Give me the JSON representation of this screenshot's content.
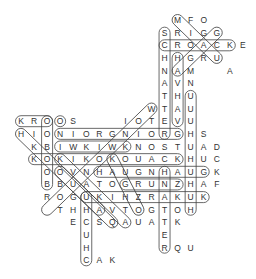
{
  "puzzle": {
    "type": "word-search",
    "grid_origin": {
      "x": 21,
      "y": 20
    },
    "cell_size": {
      "w": 13.05,
      "h": 12.65
    },
    "letters": [
      {
        "r": 0,
        "c": 12,
        "ch": "M"
      },
      {
        "r": 0,
        "c": 13,
        "ch": "F"
      },
      {
        "r": 0,
        "c": 14,
        "ch": "O"
      },
      {
        "r": 1,
        "c": 11,
        "ch": "S"
      },
      {
        "r": 1,
        "c": 12,
        "ch": "R"
      },
      {
        "r": 1,
        "c": 13,
        "ch": "I"
      },
      {
        "r": 1,
        "c": 14,
        "ch": "G"
      },
      {
        "r": 1,
        "c": 15,
        "ch": "G"
      },
      {
        "r": 2,
        "c": 11,
        "ch": "C"
      },
      {
        "r": 2,
        "c": 12,
        "ch": "R"
      },
      {
        "r": 2,
        "c": 13,
        "ch": "O"
      },
      {
        "r": 2,
        "c": 14,
        "ch": "A"
      },
      {
        "r": 2,
        "c": 15,
        "ch": "C"
      },
      {
        "r": 2,
        "c": 16,
        "ch": "K"
      },
      {
        "r": 2,
        "c": 17,
        "ch": "E"
      },
      {
        "r": 3,
        "c": 11,
        "ch": "H"
      },
      {
        "r": 3,
        "c": 12,
        "ch": "H"
      },
      {
        "r": 3,
        "c": 13,
        "ch": "G"
      },
      {
        "r": 3,
        "c": 14,
        "ch": "R"
      },
      {
        "r": 3,
        "c": 15,
        "ch": "U"
      },
      {
        "r": 4,
        "c": 11,
        "ch": "N"
      },
      {
        "r": 4,
        "c": 12,
        "ch": "A"
      },
      {
        "r": 4,
        "c": 13,
        "ch": "M"
      },
      {
        "r": 4,
        "c": 16,
        "ch": "A"
      },
      {
        "r": 5,
        "c": 11,
        "ch": "A"
      },
      {
        "r": 5,
        "c": 12,
        "ch": "V"
      },
      {
        "r": 5,
        "c": 13,
        "ch": "N"
      },
      {
        "r": 6,
        "c": 11,
        "ch": "T"
      },
      {
        "r": 6,
        "c": 12,
        "ch": "H"
      },
      {
        "r": 6,
        "c": 13,
        "ch": "U"
      },
      {
        "r": 7,
        "c": 10,
        "ch": "W"
      },
      {
        "r": 7,
        "c": 11,
        "ch": "T"
      },
      {
        "r": 7,
        "c": 12,
        "ch": "A"
      },
      {
        "r": 7,
        "c": 13,
        "ch": "U"
      },
      {
        "r": 8,
        "c": 0,
        "ch": "K"
      },
      {
        "r": 8,
        "c": 1,
        "ch": "R"
      },
      {
        "r": 8,
        "c": 2,
        "ch": "O"
      },
      {
        "r": 8,
        "c": 3,
        "ch": "O"
      },
      {
        "r": 8,
        "c": 4,
        "ch": "S"
      },
      {
        "r": 8,
        "c": 8,
        "ch": "I"
      },
      {
        "r": 8,
        "c": 9,
        "ch": "O"
      },
      {
        "r": 8,
        "c": 10,
        "ch": "T"
      },
      {
        "r": 8,
        "c": 11,
        "ch": "E"
      },
      {
        "r": 8,
        "c": 12,
        "ch": "V"
      },
      {
        "r": 8,
        "c": 13,
        "ch": "U"
      },
      {
        "r": 9,
        "c": 0,
        "ch": "H"
      },
      {
        "r": 9,
        "c": 1,
        "ch": "I"
      },
      {
        "r": 9,
        "c": 2,
        "ch": "O"
      },
      {
        "r": 9,
        "c": 3,
        "ch": "N"
      },
      {
        "r": 9,
        "c": 4,
        "ch": "I"
      },
      {
        "r": 9,
        "c": 5,
        "ch": "O"
      },
      {
        "r": 9,
        "c": 6,
        "ch": "R"
      },
      {
        "r": 9,
        "c": 7,
        "ch": "G"
      },
      {
        "r": 9,
        "c": 8,
        "ch": "N"
      },
      {
        "r": 9,
        "c": 9,
        "ch": "I"
      },
      {
        "r": 9,
        "c": 10,
        "ch": "O"
      },
      {
        "r": 9,
        "c": 11,
        "ch": "R"
      },
      {
        "r": 9,
        "c": 12,
        "ch": "G"
      },
      {
        "r": 9,
        "c": 13,
        "ch": "H"
      },
      {
        "r": 9,
        "c": 14,
        "ch": "S"
      },
      {
        "r": 10,
        "c": 1,
        "ch": "K"
      },
      {
        "r": 10,
        "c": 2,
        "ch": "B"
      },
      {
        "r": 10,
        "c": 3,
        "ch": "I"
      },
      {
        "r": 10,
        "c": 4,
        "ch": "W"
      },
      {
        "r": 10,
        "c": 5,
        "ch": "K"
      },
      {
        "r": 10,
        "c": 6,
        "ch": "I"
      },
      {
        "r": 10,
        "c": 7,
        "ch": "W"
      },
      {
        "r": 10,
        "c": 8,
        "ch": "K"
      },
      {
        "r": 10,
        "c": 9,
        "ch": "N"
      },
      {
        "r": 10,
        "c": 10,
        "ch": "O"
      },
      {
        "r": 10,
        "c": 11,
        "ch": "S"
      },
      {
        "r": 10,
        "c": 12,
        "ch": "T"
      },
      {
        "r": 10,
        "c": 13,
        "ch": "U"
      },
      {
        "r": 10,
        "c": 14,
        "ch": "A"
      },
      {
        "r": 10,
        "c": 15,
        "ch": "D"
      },
      {
        "r": 11,
        "c": 1,
        "ch": "K"
      },
      {
        "r": 11,
        "c": 2,
        "ch": "O"
      },
      {
        "r": 11,
        "c": 3,
        "ch": "K"
      },
      {
        "r": 11,
        "c": 4,
        "ch": "I"
      },
      {
        "r": 11,
        "c": 5,
        "ch": "K"
      },
      {
        "r": 11,
        "c": 6,
        "ch": "O"
      },
      {
        "r": 11,
        "c": 7,
        "ch": "K"
      },
      {
        "r": 11,
        "c": 8,
        "ch": "O"
      },
      {
        "r": 11,
        "c": 9,
        "ch": "U"
      },
      {
        "r": 11,
        "c": 10,
        "ch": "A"
      },
      {
        "r": 11,
        "c": 11,
        "ch": "C"
      },
      {
        "r": 11,
        "c": 12,
        "ch": "K"
      },
      {
        "r": 11,
        "c": 13,
        "ch": "H"
      },
      {
        "r": 11,
        "c": 14,
        "ch": "U"
      },
      {
        "r": 11,
        "c": 15,
        "ch": "C"
      },
      {
        "r": 12,
        "c": 2,
        "ch": "O"
      },
      {
        "r": 12,
        "c": 3,
        "ch": "O"
      },
      {
        "r": 12,
        "c": 4,
        "ch": "V"
      },
      {
        "r": 12,
        "c": 5,
        "ch": "N"
      },
      {
        "r": 12,
        "c": 6,
        "ch": "H"
      },
      {
        "r": 12,
        "c": 7,
        "ch": "A"
      },
      {
        "r": 12,
        "c": 8,
        "ch": "U"
      },
      {
        "r": 12,
        "c": 9,
        "ch": "G"
      },
      {
        "r": 12,
        "c": 10,
        "ch": "N"
      },
      {
        "r": 12,
        "c": 11,
        "ch": "H"
      },
      {
        "r": 12,
        "c": 12,
        "ch": "A"
      },
      {
        "r": 12,
        "c": 13,
        "ch": "U"
      },
      {
        "r": 12,
        "c": 14,
        "ch": "G"
      },
      {
        "r": 12,
        "c": 15,
        "ch": "K"
      },
      {
        "r": 13,
        "c": 2,
        "ch": "B"
      },
      {
        "r": 13,
        "c": 3,
        "ch": "B"
      },
      {
        "r": 13,
        "c": 4,
        "ch": "U"
      },
      {
        "r": 13,
        "c": 5,
        "ch": "A"
      },
      {
        "r": 13,
        "c": 6,
        "ch": "T"
      },
      {
        "r": 13,
        "c": 7,
        "ch": "O"
      },
      {
        "r": 13,
        "c": 8,
        "ch": "G"
      },
      {
        "r": 13,
        "c": 9,
        "ch": "R"
      },
      {
        "r": 13,
        "c": 10,
        "ch": "U"
      },
      {
        "r": 13,
        "c": 11,
        "ch": "N"
      },
      {
        "r": 13,
        "c": 12,
        "ch": "Z"
      },
      {
        "r": 13,
        "c": 13,
        "ch": "H"
      },
      {
        "r": 13,
        "c": 14,
        "ch": "A"
      },
      {
        "r": 13,
        "c": 15,
        "ch": "F"
      },
      {
        "r": 14,
        "c": 2,
        "ch": "R"
      },
      {
        "r": 14,
        "c": 3,
        "ch": "O"
      },
      {
        "r": 14,
        "c": 4,
        "ch": "G"
      },
      {
        "r": 14,
        "c": 5,
        "ch": "U"
      },
      {
        "r": 14,
        "c": 6,
        "ch": "K"
      },
      {
        "r": 14,
        "c": 7,
        "ch": "I"
      },
      {
        "r": 14,
        "c": 8,
        "ch": "H"
      },
      {
        "r": 14,
        "c": 9,
        "ch": "Z"
      },
      {
        "r": 14,
        "c": 10,
        "ch": "R"
      },
      {
        "r": 14,
        "c": 11,
        "ch": "A"
      },
      {
        "r": 14,
        "c": 12,
        "ch": "K"
      },
      {
        "r": 14,
        "c": 13,
        "ch": "U"
      },
      {
        "r": 14,
        "c": 14,
        "ch": "K"
      },
      {
        "r": 15,
        "c": 3,
        "ch": "T"
      },
      {
        "r": 15,
        "c": 4,
        "ch": "H"
      },
      {
        "r": 15,
        "c": 5,
        "ch": "H"
      },
      {
        "r": 15,
        "c": 6,
        "ch": "A"
      },
      {
        "r": 15,
        "c": 7,
        "ch": "V"
      },
      {
        "r": 15,
        "c": 8,
        "ch": "T"
      },
      {
        "r": 15,
        "c": 9,
        "ch": "O"
      },
      {
        "r": 15,
        "c": 10,
        "ch": "G"
      },
      {
        "r": 15,
        "c": 11,
        "ch": "T"
      },
      {
        "r": 15,
        "c": 12,
        "ch": "O"
      },
      {
        "r": 15,
        "c": 13,
        "ch": "H"
      },
      {
        "r": 16,
        "c": 4,
        "ch": "E"
      },
      {
        "r": 16,
        "c": 5,
        "ch": "C"
      },
      {
        "r": 16,
        "c": 6,
        "ch": "S"
      },
      {
        "r": 16,
        "c": 7,
        "ch": "Q"
      },
      {
        "r": 16,
        "c": 8,
        "ch": "A"
      },
      {
        "r": 16,
        "c": 9,
        "ch": "U"
      },
      {
        "r": 16,
        "c": 10,
        "ch": "A"
      },
      {
        "r": 16,
        "c": 11,
        "ch": "T"
      },
      {
        "r": 16,
        "c": 12,
        "ch": "K"
      },
      {
        "r": 17,
        "c": 5,
        "ch": "U"
      },
      {
        "r": 17,
        "c": 11,
        "ch": "E"
      },
      {
        "r": 18,
        "c": 5,
        "ch": "H"
      },
      {
        "r": 18,
        "c": 11,
        "ch": "R"
      },
      {
        "r": 18,
        "c": 12,
        "ch": "Q"
      },
      {
        "r": 18,
        "c": 13,
        "ch": "U"
      },
      {
        "r": 19,
        "c": 5,
        "ch": "C"
      },
      {
        "r": 19,
        "c": 6,
        "ch": "A"
      },
      {
        "r": 19,
        "c": 7,
        "ch": "K"
      }
    ],
    "found_words": [
      {
        "r1": 2,
        "c1": 11,
        "r2": 2,
        "c2": 16
      },
      {
        "r1": 1,
        "c1": 11,
        "r2": 9,
        "c2": 11
      },
      {
        "r1": 3,
        "c1": 12,
        "r2": 8,
        "c2": 12
      },
      {
        "r1": 6,
        "c1": 13,
        "r2": 15,
        "c2": 13
      },
      {
        "r1": 0,
        "c1": 12,
        "r2": 3,
        "c2": 15
      },
      {
        "r1": 1,
        "c1": 15,
        "r2": 4,
        "c2": 12
      },
      {
        "r1": 8,
        "c1": 0,
        "r2": 8,
        "c2": 2
      },
      {
        "r1": 8,
        "c1": 3,
        "r2": 8,
        "c2": 3
      },
      {
        "r1": 8,
        "c1": 2,
        "r2": 13,
        "c2": 2
      },
      {
        "r1": 9,
        "c1": 3,
        "r2": 9,
        "c2": 12
      },
      {
        "r1": 10,
        "c1": 3,
        "r2": 10,
        "c2": 8
      },
      {
        "r1": 11,
        "c1": 1,
        "r2": 11,
        "c2": 12
      },
      {
        "r1": 12,
        "c1": 6,
        "r2": 12,
        "c2": 14
      },
      {
        "r1": 13,
        "c1": 8,
        "r2": 13,
        "c2": 12
      },
      {
        "r1": 14,
        "c1": 5,
        "r2": 14,
        "c2": 14
      },
      {
        "r1": 14,
        "c1": 5,
        "r2": 19,
        "c2": 5
      },
      {
        "r1": 12,
        "c1": 11,
        "r2": 18,
        "c2": 11
      },
      {
        "r1": 7,
        "c1": 10,
        "r2": 15,
        "c2": 2
      },
      {
        "r1": 9,
        "c1": 0,
        "r2": 16,
        "c2": 7
      },
      {
        "r1": 11,
        "c1": 3,
        "r2": 16,
        "c2": 8
      },
      {
        "r1": 12,
        "c1": 3,
        "r2": 15,
        "c2": 6
      },
      {
        "r1": 11,
        "c1": 7,
        "r2": 15,
        "c2": 9
      }
    ]
  }
}
